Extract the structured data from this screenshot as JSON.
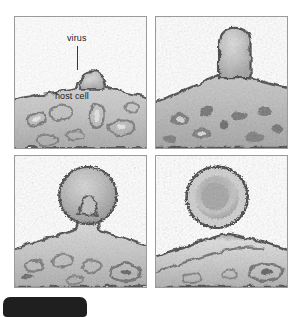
{
  "figure": {
    "kind": "electron-micrograph-series",
    "top_cut_text": "",
    "bottom_chip_text": "",
    "panel_count": 4,
    "panels": [
      {
        "id": "panel-1",
        "position": "top-left",
        "stage": "attachment / early bud",
        "labels": [
          {
            "name": "virus-label",
            "text": "virus"
          },
          {
            "name": "host-cell-label",
            "text": "host cell"
          }
        ]
      },
      {
        "id": "panel-2",
        "position": "top-right",
        "stage": "elongating bud",
        "labels": []
      },
      {
        "id": "panel-3",
        "position": "bottom-left",
        "stage": "budding on narrow stalk",
        "labels": []
      },
      {
        "id": "panel-4",
        "position": "bottom-right",
        "stage": "released free virion",
        "labels": []
      }
    ]
  },
  "colors": {
    "page_background": "#ffffff",
    "panel_border": "#9a9a9a",
    "cell_light": "#e3e3e3",
    "cell_mid": "#b4b4b4",
    "cell_dark": "#5e5e5e",
    "membrane_dark": "#3c3c3c",
    "virion_envelope": "#c9c9c9",
    "virion_core": "#9d9d9d",
    "virion_rim": "#4a4a4a",
    "label_text": "#1b1b1b",
    "leader_line": "#3a3a3a",
    "chip_fill": "#1f1f1f"
  }
}
